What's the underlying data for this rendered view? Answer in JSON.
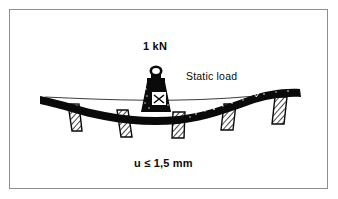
{
  "figure": {
    "title_visible": false,
    "background_color": "#ffffff",
    "border_color": "#8e8e8e",
    "ink_color": "#0a0a0a"
  },
  "labels": {
    "force": "1 kN",
    "load_type": "Static load",
    "deflection_limit": "u ≤ 1,5 mm"
  },
  "diagram": {
    "beam": {
      "name": "deflected-beam",
      "description_visible": false,
      "fill_color": "#0a0a0a"
    },
    "datum_line": {
      "name": "undeflected-reference-line",
      "color": "#0a0a0a"
    },
    "weight": {
      "name": "static-load-weight",
      "fill_color": "#0a0a0a"
    },
    "supports_count": 5
  }
}
